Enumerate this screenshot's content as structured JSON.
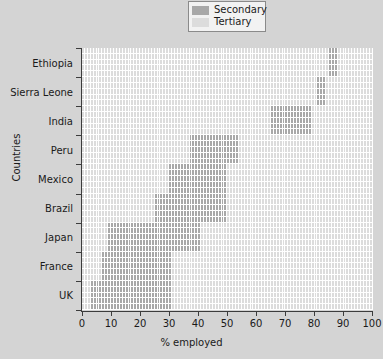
{
  "chart_data": {
    "type": "bar",
    "title": "",
    "xlabel": "% employed",
    "ylabel": "Countries",
    "xlim": [
      0,
      100
    ],
    "grid": true,
    "legend_position": "top-center",
    "legend": [
      {
        "name": "Secondary",
        "color": "#a8a8a8"
      },
      {
        "name": "Tertiary",
        "color": "#dcdcdc"
      }
    ],
    "xticks": [
      {
        "value": 0,
        "label": "0"
      },
      {
        "value": 10,
        "label": "10"
      },
      {
        "value": 20,
        "label": "20"
      },
      {
        "value": 30,
        "label": "30"
      },
      {
        "value": 40,
        "label": "40"
      },
      {
        "value": 50,
        "label": "50"
      },
      {
        "value": 60,
        "label": "60"
      },
      {
        "value": 70,
        "label": "70"
      },
      {
        "value": 80,
        "label": "80"
      },
      {
        "value": 90,
        "label": "90"
      },
      {
        "value": 100,
        "label": "100"
      }
    ],
    "categories": [
      "Ethiopia",
      "Sierra Leone",
      "India",
      "Peru",
      "Mexico",
      "Brazil",
      "Japan",
      "France",
      "UK"
    ],
    "series": [
      {
        "name": "Secondary",
        "color": "#a8a8a8",
        "ranges": [
          {
            "category": "Ethiopia",
            "start": 85,
            "end": 88,
            "value": 3
          },
          {
            "category": "Sierra Leone",
            "start": 81,
            "end": 84,
            "value": 3
          },
          {
            "category": "India",
            "start": 65,
            "end": 79,
            "value": 14
          },
          {
            "category": "Peru",
            "start": 37,
            "end": 54,
            "value": 17
          },
          {
            "category": "Mexico",
            "start": 30,
            "end": 50,
            "value": 20
          },
          {
            "category": "Brazil",
            "start": 25,
            "end": 50,
            "value": 25
          },
          {
            "category": "Japan",
            "start": 9,
            "end": 41,
            "value": 32
          },
          {
            "category": "France",
            "start": 7,
            "end": 31,
            "value": 24
          },
          {
            "category": "UK",
            "start": 3,
            "end": 31,
            "value": 28
          }
        ]
      },
      {
        "name": "Tertiary",
        "color": "#dcdcdc",
        "note": "All remaining cells in each row"
      }
    ]
  },
  "colors": {
    "background": "#d4d4d4",
    "plot_background": "#ffffff",
    "secondary": "#a8a8a8",
    "tertiary": "#dcdcdc",
    "axis": "#3c3c3c",
    "text": "#1a1a1a"
  }
}
